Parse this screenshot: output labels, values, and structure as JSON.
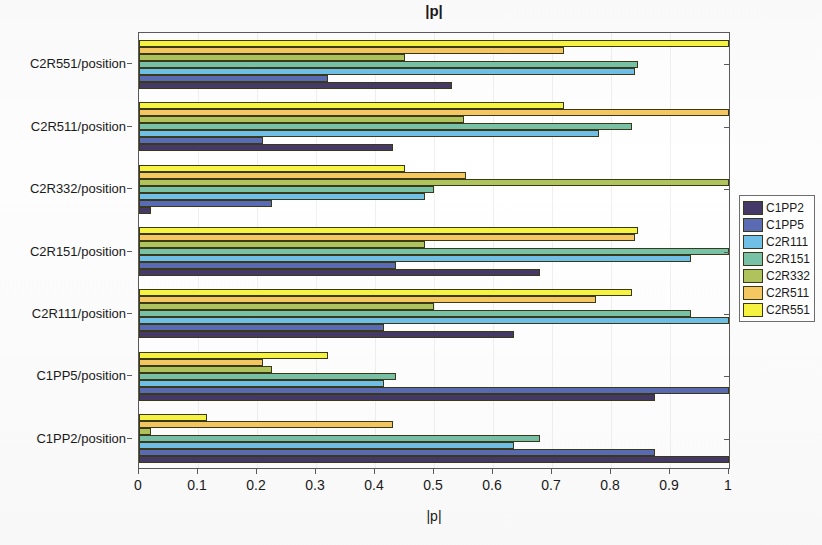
{
  "chart_data": {
    "type": "bar",
    "orientation": "horizontal",
    "title": "|p|",
    "xlabel": "|p|",
    "ylabel": "",
    "xlim": [
      0,
      1
    ],
    "xticks": [
      "0",
      "0.1",
      "0.2",
      "0.3",
      "0.4",
      "0.5",
      "0.6",
      "0.7",
      "0.8",
      "0.9",
      "1"
    ],
    "xtick_values": [
      0,
      0.1,
      0.2,
      0.3,
      0.4,
      0.5,
      0.6,
      0.7,
      0.8,
      0.9,
      1
    ],
    "grid": false,
    "legend_position": "right-outside",
    "categories": [
      "C1PP2/position",
      "C1PP5/position",
      "C2R111/position",
      "C2R151/position",
      "C2R332/position",
      "C2R511/position",
      "C2R551/position"
    ],
    "series": [
      {
        "name": "C1PP2",
        "color": "#453A67",
        "values": [
          1.0,
          0.875,
          0.635,
          0.68,
          0.02,
          0.43,
          0.53
        ]
      },
      {
        "name": "C1PP5",
        "color": "#5A6BB5",
        "values": [
          0.875,
          1.0,
          0.415,
          0.435,
          0.225,
          0.21,
          0.32
        ]
      },
      {
        "name": "C2R111",
        "color": "#6FC0E8",
        "values": [
          0.635,
          0.415,
          1.0,
          0.935,
          0.485,
          0.78,
          0.84
        ]
      },
      {
        "name": "C2R151",
        "color": "#78C2A8",
        "values": [
          0.68,
          0.435,
          0.935,
          1.0,
          0.5,
          0.835,
          0.845
        ]
      },
      {
        "name": "C2R332",
        "color": "#AFC45C",
        "values": [
          0.02,
          0.225,
          0.5,
          0.485,
          1.0,
          0.55,
          0.45
        ]
      },
      {
        "name": "C2R511",
        "color": "#F6C862",
        "values": [
          0.43,
          0.21,
          0.775,
          0.84,
          0.555,
          1.0,
          0.72
        ]
      },
      {
        "name": "C2R551",
        "color": "#F7F441",
        "values": [
          0.115,
          0.32,
          0.835,
          0.845,
          0.45,
          0.72,
          1.0
        ]
      }
    ]
  },
  "legend": {
    "items": [
      {
        "label": "C1PP2",
        "color": "#453A67"
      },
      {
        "label": "C1PP5",
        "color": "#5A6BB5"
      },
      {
        "label": "C2R111",
        "color": "#6FC0E8"
      },
      {
        "label": "C2R151",
        "color": "#78C2A8"
      },
      {
        "label": "C2R332",
        "color": "#AFC45C"
      },
      {
        "label": "C2R511",
        "color": "#F6C862"
      },
      {
        "label": "C2R551",
        "color": "#F7F441"
      }
    ]
  }
}
